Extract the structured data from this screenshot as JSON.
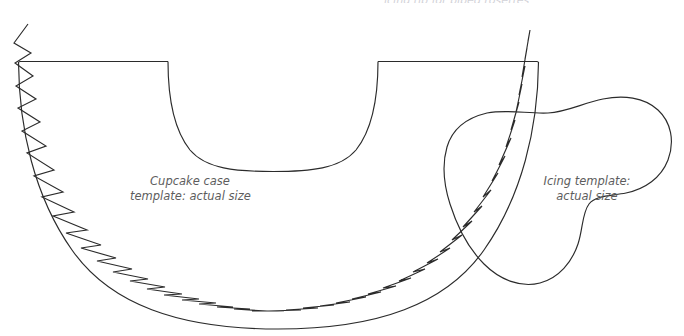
{
  "page": {
    "background_color": "#ffffff",
    "width": 684,
    "height": 336
  },
  "ink": {
    "line_color": "#2b2b2b",
    "line_width": 1.15,
    "caption_color": "#5d5d5d",
    "cut_caption_color": "#d2d2d8"
  },
  "captions": {
    "top_cut_off": "icing tip for piped rosettes",
    "cupcake": {
      "line1": "Cupcake case",
      "line2": "template: actual size",
      "full": "Cupcake case template: actual size"
    },
    "icing": {
      "line1": "Icing template:",
      "line2": "actual size",
      "full": "Icing template: actual size"
    }
  },
  "shapes": {
    "cupcake_case": {
      "name": "cupcake-case-template",
      "description": "Large semi-circular cupcake case template with straight top edge, inner U-shaped cut and saw-tooth zigzag trim following the inner side of the outer arc.",
      "top_edge": {
        "x1": 20,
        "y1": 61,
        "x2": 537,
        "y2": 61
      },
      "inner_arc": {
        "left_x": 168,
        "right_x": 378,
        "top_y": 61,
        "bottom_y": 171
      },
      "outer_arc": {
        "left_x": 18,
        "right_x": 539,
        "top_y": 61,
        "bottom_y": 328
      },
      "outline_path": "M 20 61 L 168 61 C 168 118 180 171 273 171 C 366 171 378 118 378 61 L 537 61",
      "outer_arc_path": "M 18 62 C 19 205 135 328 278 328 C 421 328 538 205 539 62"
    },
    "icing": {
      "name": "icing-template",
      "description": "Irregular rounded blob shape (piped icing swirl outline) overlapping the right portion of the cupcake case.",
      "bounds": {
        "x": 443,
        "y": 99,
        "width": 227,
        "height": 230
      },
      "outline_path": "M 470 121 C 452 131 443 148 443 168 C 443 196 449 226 466 245 C 484 265 505 277 528 276 C 551 275 566 262 575 247 C 584 232 586 214 598 207 C 612 199 633 202 647 195 C 663 187 670 171 670 153 C 670 131 657 114 638 105 C 619 96 594 99 572 104 C 548 109 524 112 504 112 C 489 112 481 115 470 121 Z"
    }
  },
  "zigzag": {
    "name": "saw-tooth-trim",
    "description": "Hand-drawn pinked/zigzag cutting line that runs just inside the outer arc of the cupcake case, from the top-left above the straight edge, around the bottom, up to the top-right above the straight edge.",
    "tooth_count": 46,
    "start": {
      "x": 28,
      "y": 24
    },
    "end": {
      "x": 530,
      "y": 30
    }
  },
  "icons": {
    "template_outline": "template-outline-icon",
    "scissors_trim": "zigzag-trim-icon"
  }
}
